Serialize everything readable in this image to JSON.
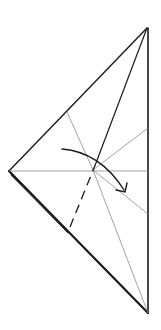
{
  "diagram": {
    "type": "origami-fold-step",
    "colors": {
      "stroke": "#1a1a1a",
      "thin_stroke": "#8a8a8a",
      "background": "#ffffff"
    },
    "points": {
      "top": [
        147,
        28
      ],
      "bottom": [
        148,
        313
      ],
      "left": [
        9,
        171
      ],
      "center": [
        93,
        170
      ]
    },
    "annotations": {
      "valley_fold": "dashed line",
      "arrow": "curved fold arrow"
    }
  }
}
